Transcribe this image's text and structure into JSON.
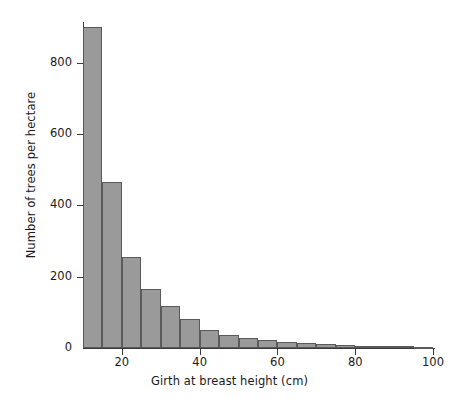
{
  "chart_data": {
    "type": "bar",
    "title": "",
    "subtitle": "",
    "xlabel": "Girth at breast height (cm)",
    "ylabel": "Number of trees per hectare",
    "xlim": [
      5,
      102
    ],
    "ylim": [
      0,
      930
    ],
    "grid": false,
    "legend": null,
    "bin_width": 5,
    "xticks": [
      {
        "value": 20,
        "label": "20"
      },
      {
        "value": 40,
        "label": "40"
      },
      {
        "value": 60,
        "label": "60"
      },
      {
        "value": 80,
        "label": "80"
      },
      {
        "value": 100,
        "label": "100"
      }
    ],
    "yticks": [
      {
        "value": 0,
        "label": "0"
      },
      {
        "value": 200,
        "label": "200"
      },
      {
        "value": 400,
        "label": "400"
      },
      {
        "value": 600,
        "label": "600"
      },
      {
        "value": 800,
        "label": "800"
      }
    ],
    "bar_color": "#9a9a9a",
    "bar_edge_color": "#5a5a5a",
    "axis_color": "#3a3a3a",
    "background_color": "#ffffff",
    "bins": [
      {
        "x0": 10,
        "x1": 15,
        "value": 900
      },
      {
        "x0": 15,
        "x1": 20,
        "value": 465
      },
      {
        "x0": 20,
        "x1": 25,
        "value": 255
      },
      {
        "x0": 25,
        "x1": 30,
        "value": 165
      },
      {
        "x0": 30,
        "x1": 35,
        "value": 117
      },
      {
        "x0": 35,
        "x1": 40,
        "value": 82
      },
      {
        "x0": 40,
        "x1": 45,
        "value": 50
      },
      {
        "x0": 45,
        "x1": 50,
        "value": 37
      },
      {
        "x0": 50,
        "x1": 55,
        "value": 28
      },
      {
        "x0": 55,
        "x1": 60,
        "value": 22
      },
      {
        "x0": 60,
        "x1": 65,
        "value": 18
      },
      {
        "x0": 65,
        "x1": 70,
        "value": 15
      },
      {
        "x0": 70,
        "x1": 75,
        "value": 12
      },
      {
        "x0": 75,
        "x1": 80,
        "value": 9
      },
      {
        "x0": 80,
        "x1": 85,
        "value": 7
      },
      {
        "x0": 85,
        "x1": 90,
        "value": 6
      },
      {
        "x0": 90,
        "x1": 95,
        "value": 5
      },
      {
        "x0": 95,
        "x1": 100,
        "value": 4
      }
    ]
  }
}
